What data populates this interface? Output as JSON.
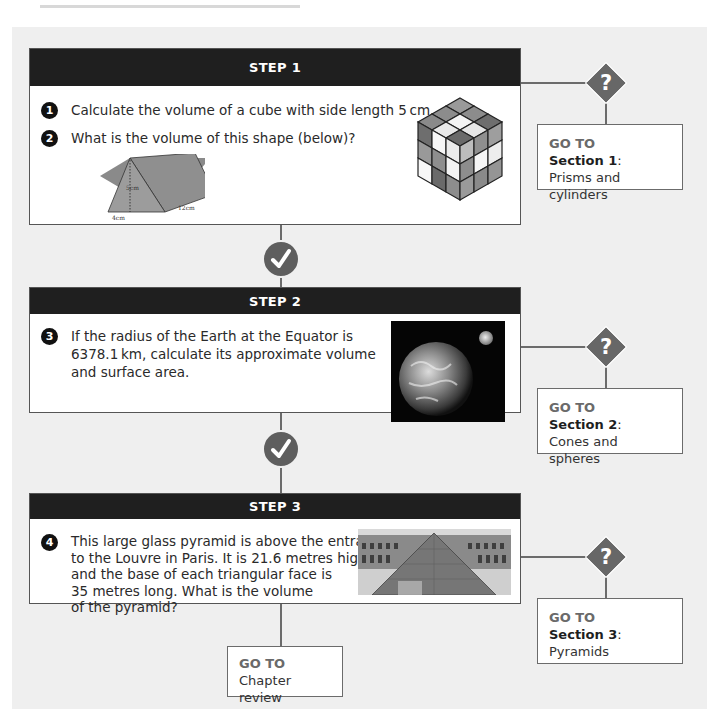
{
  "page": {
    "background_color": "#efefef",
    "header_color": "#1f1f1f",
    "icon_color": "#676767"
  },
  "steps": [
    {
      "title": "STEP 1",
      "questions": [
        {
          "number": "1",
          "text": "Calculate the volume of a cube with side length 5 cm."
        },
        {
          "number": "2",
          "text": "What is the volume of this shape (below)?"
        }
      ],
      "figures": {
        "prism": {
          "height_label": "5cm",
          "base_label": "4cm",
          "length_label": "12cm"
        },
        "cube_image": "rubiks-cube-illustration"
      },
      "goto": {
        "label": "GO TO",
        "section": "Section 1",
        "colon": ":",
        "title": "Prisms and cylinders"
      }
    },
    {
      "title": "STEP 2",
      "questions": [
        {
          "number": "3",
          "text": "If the radius of the Earth at the Equator is\n6378.1 km, calculate its approximate volume\nand surface area."
        }
      ],
      "figures": {
        "image": "earth-and-moon-photo"
      },
      "goto": {
        "label": "GO TO",
        "section": "Section 2",
        "colon": ":",
        "title": "Cones and spheres"
      }
    },
    {
      "title": "STEP 3",
      "questions": [
        {
          "number": "4",
          "text": "This large glass pyramid is above the entrance\nto the Louvre in Paris. It is 21.6 metres high\nand the base of each triangular face is\n35 metres long. What is the volume\nof the pyramid?"
        }
      ],
      "figures": {
        "image": "louvre-pyramid-photo"
      },
      "goto": {
        "label": "GO TO",
        "section": "Section 3",
        "colon": ":",
        "title": "Pyramids"
      }
    }
  ],
  "final": {
    "label": "GO TO",
    "title": "Chapter review"
  },
  "icons": {
    "question": "?",
    "check": "check-icon"
  }
}
